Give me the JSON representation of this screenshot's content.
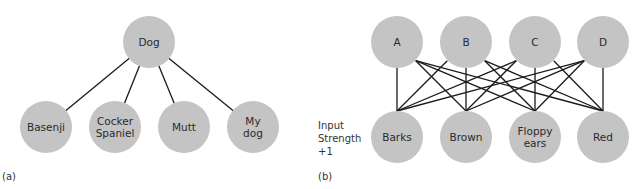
{
  "panel_a": {
    "caption": "(a)",
    "root": {
      "label": "Dog",
      "x": 149,
      "y": 42
    },
    "children": [
      {
        "lines": [
          "Basenji"
        ],
        "x": 46,
        "y": 127
      },
      {
        "lines": [
          "Cocker",
          "Spaniel"
        ],
        "x": 115,
        "y": 127
      },
      {
        "lines": [
          "Mutt"
        ],
        "x": 184,
        "y": 127
      },
      {
        "lines": [
          "My",
          "dog"
        ],
        "x": 253,
        "y": 127
      }
    ]
  },
  "panel_b": {
    "caption": "(b)",
    "side_label": [
      "Input",
      "Strength",
      "+1"
    ],
    "top": [
      {
        "label": "A",
        "x": 397,
        "y": 42
      },
      {
        "label": "B",
        "x": 466,
        "y": 42
      },
      {
        "label": "C",
        "x": 535,
        "y": 42
      },
      {
        "label": "D",
        "x": 603,
        "y": 42
      }
    ],
    "bottom": [
      {
        "lines": [
          "Barks"
        ],
        "x": 397,
        "y": 137
      },
      {
        "lines": [
          "Brown"
        ],
        "x": 466,
        "y": 137
      },
      {
        "lines": [
          "Floppy",
          "ears"
        ],
        "x": 535,
        "y": 137
      },
      {
        "lines": [
          "Red"
        ],
        "x": 603,
        "y": 137
      }
    ],
    "connectivity": "fully-connected"
  },
  "style": {
    "node_fill": "#c4c4c4",
    "edge_color": "#1a1a1a",
    "radius": 26
  }
}
